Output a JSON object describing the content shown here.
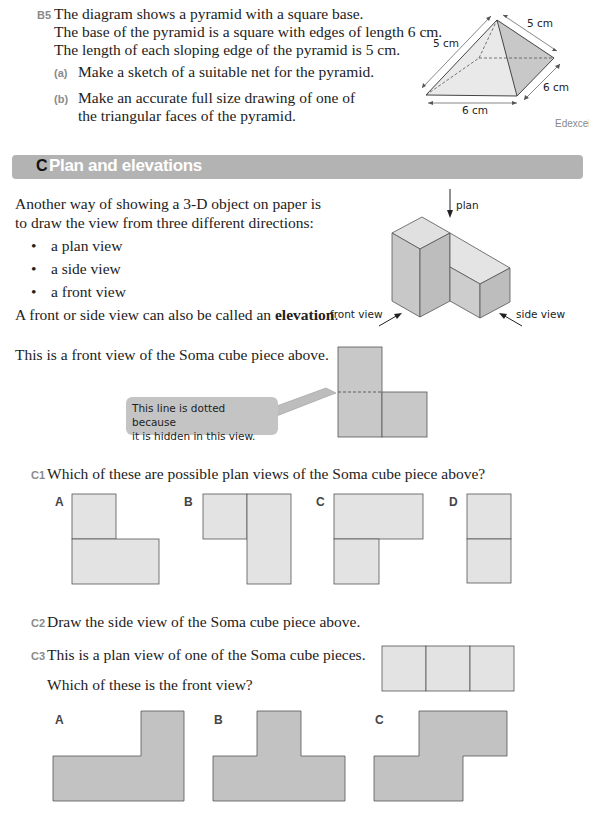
{
  "b5": {
    "number": "B5",
    "lines": [
      "The diagram shows a pyramid with a square base.",
      "The base of the pyramid is a square with edges of length 6 cm.",
      "The length of each sloping edge of the pyramid is 5 cm."
    ],
    "parts": [
      {
        "label": "(a)",
        "lines": [
          "Make a sketch of a suitable net for the pyramid."
        ]
      },
      {
        "label": "(b)",
        "lines": [
          "Make an accurate full size drawing of one of",
          "the triangular faces of the pyramid."
        ]
      }
    ],
    "diagram": {
      "labels": {
        "slope_left": "5 cm",
        "slope_right": "5 cm",
        "base_front": "6 cm",
        "base_side": "6 cm"
      },
      "source": "Edexcel"
    }
  },
  "section": {
    "letter": "C",
    "title": "Plan and elevations"
  },
  "intro": {
    "lines": [
      "Another way of showing a 3-D object on paper is",
      "to draw the view from three different directions:"
    ],
    "bullets": [
      "a plan view",
      "a side view",
      "a front view"
    ],
    "elevation_prefix": "A front or side view can also be called an ",
    "elevation_bold": "elevation",
    "elevation_suffix": ".",
    "diagram_labels": {
      "plan": "plan",
      "front": "front view",
      "side": "side view"
    }
  },
  "front_view": {
    "text": "This is a front view of the Soma cube piece above.",
    "callout": [
      "This line is dotted because",
      "it is hidden in this view."
    ]
  },
  "c1": {
    "number": "C1",
    "text": "Which of these are possible plan views of the Soma cube piece above?",
    "options": [
      "A",
      "B",
      "C",
      "D"
    ]
  },
  "c2": {
    "number": "C2",
    "text": "Draw the side view of the Soma cube piece above."
  },
  "c3": {
    "number": "C3",
    "text": "This is a plan view of one of the Soma cube pieces.",
    "question": "Which of these is the front view?",
    "options": [
      "A",
      "B",
      "C"
    ]
  },
  "colors": {
    "header_bar": "#b3b3b3",
    "light_fill": "#e3e3e3",
    "dark_fill": "#c2c2c2",
    "question_number": "#8a8a8a"
  }
}
